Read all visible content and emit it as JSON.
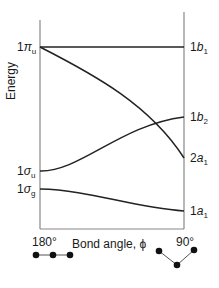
{
  "diagram": {
    "y_axis_label": "Energy",
    "x_axis_label": "Bond angle, ϕ",
    "x_left_tick": "180°",
    "x_right_tick": "90°",
    "left_labels": [
      {
        "num": "1",
        "sym": "π",
        "sub": "u"
      },
      {
        "num": "1",
        "sym": "σ",
        "sub": "u"
      },
      {
        "num": "1",
        "sym": "σ",
        "sub": "g"
      }
    ],
    "right_labels": [
      {
        "num": "1",
        "sym": "b",
        "sub": "1"
      },
      {
        "num": "1",
        "sym": "b",
        "sub": "2"
      },
      {
        "num": "2",
        "sym": "a",
        "sub": "1"
      },
      {
        "num": "1",
        "sym": "a",
        "sub": "1"
      }
    ],
    "correlations": [
      {
        "from": "1πu",
        "to": "1b1",
        "shape": "flat"
      },
      {
        "from": "1πu",
        "to": "2a1",
        "shape": "descending"
      },
      {
        "from": "1σu",
        "to": "1b2",
        "shape": "ascending"
      },
      {
        "from": "1σg",
        "to": "1a1",
        "shape": "slightly descending"
      }
    ],
    "linear_geometry_icon": "linear-molecule",
    "bent_geometry_icon": "bent-molecule"
  }
}
